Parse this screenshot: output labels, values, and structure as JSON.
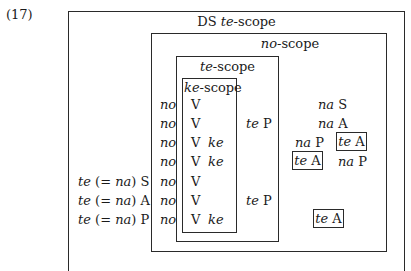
{
  "example_number": "(17)",
  "scopes": {
    "ds_te": {
      "prefix": "DS ",
      "marker": "te",
      "suffix": "-scope"
    },
    "no": {
      "marker": "no",
      "suffix": "-scope"
    },
    "te": {
      "marker": "te",
      "suffix": "-scope"
    },
    "ke": {
      "marker": "ke",
      "suffix": "-scope"
    }
  },
  "rows": [
    {
      "left": "",
      "no": "no",
      "v": "V",
      "ke": "",
      "te_col": "",
      "right_a": "",
      "right_b": "na S"
    },
    {
      "left": "",
      "no": "no",
      "v": "V",
      "ke": "",
      "te_col": "te P",
      "right_a": "",
      "right_b": "na A"
    },
    {
      "left": "",
      "no": "no",
      "v": "V",
      "ke": "ke",
      "te_col": "",
      "right_a": "na P",
      "right_b": "te A"
    },
    {
      "left": "",
      "no": "no",
      "v": "V",
      "ke": "ke",
      "te_col": "",
      "right_a": "te A",
      "right_b": "na P"
    },
    {
      "left": "te (= na) S",
      "no": "no",
      "v": "V",
      "ke": "",
      "te_col": "",
      "right_a": "",
      "right_b": ""
    },
    {
      "left": "te (= na) A",
      "no": "no",
      "v": "V",
      "ke": "",
      "te_col": "te P",
      "right_a": "",
      "right_b": ""
    },
    {
      "left": "te (= na) P",
      "no": "no",
      "v": "V",
      "ke": "ke",
      "te_col": "",
      "right_a": "",
      "right_b": "te A"
    }
  ],
  "labels": {
    "te": "te",
    "na": "na",
    "no": "no",
    "ke": "ke",
    "V": "V",
    "S": "S",
    "A": "A",
    "P": "P",
    "eq_open": "(= ",
    "close": ")"
  }
}
